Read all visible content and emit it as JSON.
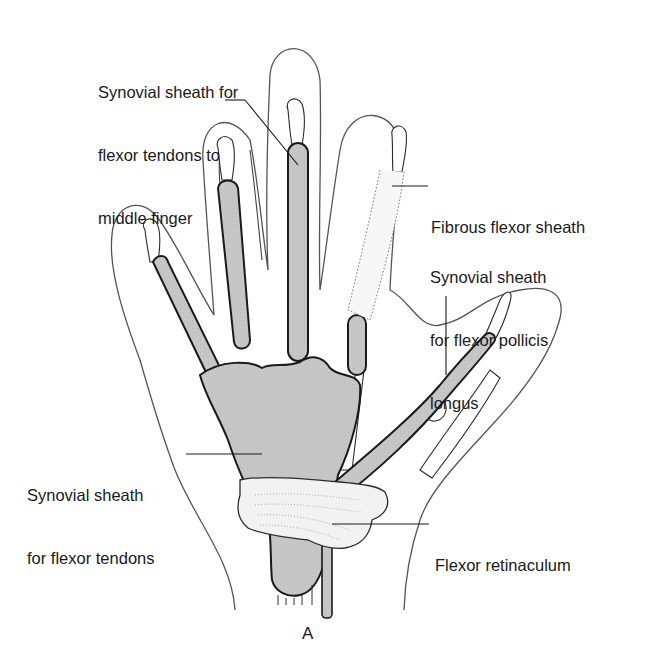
{
  "figure": {
    "panel_letter": "A",
    "colors": {
      "background": "#ffffff",
      "outline": "#2a2a2a",
      "sheath_fill": "#c6c6c6",
      "bone_fill": "#ffffff",
      "retinaculum_fill": "#f2f2f2"
    }
  },
  "labels": {
    "middle_finger_sheath": {
      "line1": "Synovial sheath for",
      "line2": "flexor tendons to",
      "line3": "middle finger"
    },
    "fibrous_flexor_sheath": {
      "line1": "Fibrous flexor sheath"
    },
    "flexor_pollicis_longus_sheath": {
      "line1": "Synovial sheath",
      "line2": "for flexor pollicis",
      "line3": "longus"
    },
    "flexor_tendons_sheath": {
      "line1": "Synovial sheath",
      "line2": "for flexor tendons"
    },
    "flexor_retinaculum": {
      "line1": "Flexor retinaculum"
    }
  }
}
